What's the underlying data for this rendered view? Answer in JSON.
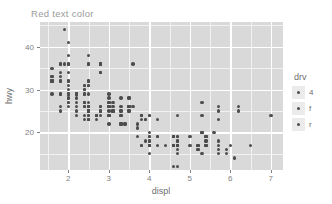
{
  "title": "Red text color",
  "colors": {
    "title_text": "#9a9a9a",
    "panel_background": "#d9d9d9",
    "grid_major": "#ffffff",
    "grid_minor": "#f2f2f2",
    "point": "#4d4d4d",
    "axis_text": "#808080",
    "legend_key_background": "#ebebeb"
  },
  "axes": {
    "x": {
      "label": "displ",
      "ticks": [
        "2",
        "3",
        "4",
        "5",
        "6",
        "7"
      ],
      "tick_values": [
        2,
        3,
        4,
        5,
        6,
        7
      ],
      "minor_values": [
        1.5,
        2.5,
        3.5,
        4.5,
        5.5,
        6.5
      ],
      "range": [
        1.3,
        7.3
      ]
    },
    "y": {
      "label": "hwy",
      "ticks": [
        "20",
        "30",
        "40"
      ],
      "tick_values": [
        20,
        30,
        40
      ],
      "minor_values": [
        15,
        25,
        35,
        45
      ],
      "range": [
        11.2,
        45.8
      ]
    }
  },
  "legend": {
    "title": "drv",
    "position": "right",
    "items": [
      {
        "label": "4"
      },
      {
        "label": "f"
      },
      {
        "label": "r"
      }
    ]
  },
  "chart_data": {
    "type": "scatter",
    "title": "Red text color",
    "xlabel": "displ",
    "ylabel": "hwy",
    "xlim": [
      1.3,
      7.3
    ],
    "ylim": [
      11.2,
      45.8
    ],
    "grid": true,
    "legend_position": "right",
    "series": [
      {
        "name": "all points",
        "points": [
          [
            1.8,
            29
          ],
          [
            1.8,
            29
          ],
          [
            2.0,
            31
          ],
          [
            2.0,
            30
          ],
          [
            2.8,
            26
          ],
          [
            2.8,
            26
          ],
          [
            3.1,
            27
          ],
          [
            1.8,
            26
          ],
          [
            1.8,
            25
          ],
          [
            2.0,
            28
          ],
          [
            2.0,
            27
          ],
          [
            2.8,
            25
          ],
          [
            2.8,
            25
          ],
          [
            3.1,
            25
          ],
          [
            3.1,
            25
          ],
          [
            2.8,
            24
          ],
          [
            3.1,
            25
          ],
          [
            4.2,
            23
          ],
          [
            5.3,
            20
          ],
          [
            5.3,
            15
          ],
          [
            5.3,
            20
          ],
          [
            5.7,
            17
          ],
          [
            6.0,
            17
          ],
          [
            5.7,
            26
          ],
          [
            5.7,
            23
          ],
          [
            6.2,
            26
          ],
          [
            6.2,
            25
          ],
          [
            7.0,
            24
          ],
          [
            5.3,
            24
          ],
          [
            5.3,
            27
          ],
          [
            5.7,
            25
          ],
          [
            6.5,
            17
          ],
          [
            2.4,
            26
          ],
          [
            2.4,
            23
          ],
          [
            3.1,
            26
          ],
          [
            3.5,
            26
          ],
          [
            3.6,
            26
          ],
          [
            2.4,
            27
          ],
          [
            3.0,
            26
          ],
          [
            3.3,
            26
          ],
          [
            3.3,
            24
          ],
          [
            3.3,
            24
          ],
          [
            3.3,
            22
          ],
          [
            3.3,
            22
          ],
          [
            3.8,
            24
          ],
          [
            3.8,
            24
          ],
          [
            4.0,
            17
          ],
          [
            3.7,
            22
          ],
          [
            3.7,
            21
          ],
          [
            3.9,
            23
          ],
          [
            3.9,
            23
          ],
          [
            4.7,
            19
          ],
          [
            4.7,
            18
          ],
          [
            4.7,
            17
          ],
          [
            5.2,
            17
          ],
          [
            5.2,
            16
          ],
          [
            3.9,
            18
          ],
          [
            4.7,
            18
          ],
          [
            4.7,
            15
          ],
          [
            4.7,
            17
          ],
          [
            5.2,
            17
          ],
          [
            5.7,
            16
          ],
          [
            5.9,
            16
          ],
          [
            4.7,
            17
          ],
          [
            4.7,
            17
          ],
          [
            4.7,
            17
          ],
          [
            4.7,
            16
          ],
          [
            4.7,
            17
          ],
          [
            5.2,
            16
          ],
          [
            5.2,
            17
          ],
          [
            5.7,
            15
          ],
          [
            5.9,
            15
          ],
          [
            4.6,
            17
          ],
          [
            5.4,
            17
          ],
          [
            5.4,
            18
          ],
          [
            4.0,
            17
          ],
          [
            4.0,
            19
          ],
          [
            4.0,
            17
          ],
          [
            4.0,
            19
          ],
          [
            4.6,
            19
          ],
          [
            5.0,
            19
          ],
          [
            4.2,
            19
          ],
          [
            4.2,
            19
          ],
          [
            4.6,
            19
          ],
          [
            4.6,
            19
          ],
          [
            4.6,
            19
          ],
          [
            5.4,
            17
          ],
          [
            5.4,
            17
          ],
          [
            3.8,
            17
          ],
          [
            3.8,
            17
          ],
          [
            4.0,
            18
          ],
          [
            4.0,
            18
          ],
          [
            4.6,
            17
          ],
          [
            4.6,
            17
          ],
          [
            4.6,
            17
          ],
          [
            4.6,
            17
          ],
          [
            5.4,
            18
          ],
          [
            1.6,
            33
          ],
          [
            1.6,
            32
          ],
          [
            1.6,
            32
          ],
          [
            1.6,
            29
          ],
          [
            1.6,
            32
          ],
          [
            1.8,
            34
          ],
          [
            1.8,
            36
          ],
          [
            1.8,
            36
          ],
          [
            2.0,
            29
          ],
          [
            2.4,
            26
          ],
          [
            2.4,
            27
          ],
          [
            2.4,
            30
          ],
          [
            2.4,
            31
          ],
          [
            2.5,
            26
          ],
          [
            2.5,
            26
          ],
          [
            3.3,
            28
          ],
          [
            2.0,
            26
          ],
          [
            2.0,
            29
          ],
          [
            2.0,
            28
          ],
          [
            2.0,
            27
          ],
          [
            2.7,
            24
          ],
          [
            2.7,
            24
          ],
          [
            2.7,
            24
          ],
          [
            3.0,
            22
          ],
          [
            3.7,
            19
          ],
          [
            4.0,
            20
          ],
          [
            4.7,
            17
          ],
          [
            4.7,
            12
          ],
          [
            4.7,
            19
          ],
          [
            5.7,
            18
          ],
          [
            6.1,
            14
          ],
          [
            4.0,
            15
          ],
          [
            4.2,
            17
          ],
          [
            4.4,
            17
          ],
          [
            4.6,
            17
          ],
          [
            5.4,
            19
          ],
          [
            5.4,
            19
          ],
          [
            5.4,
            19
          ],
          [
            4.0,
            17
          ],
          [
            4.0,
            17
          ],
          [
            4.6,
            12
          ],
          [
            5.0,
            17
          ],
          [
            2.4,
            31
          ],
          [
            2.4,
            30
          ],
          [
            2.5,
            31
          ],
          [
            2.5,
            31
          ],
          [
            3.5,
            28
          ],
          [
            3.5,
            28
          ],
          [
            3.0,
            27
          ],
          [
            3.0,
            26
          ],
          [
            3.5,
            25
          ],
          [
            3.5,
            25
          ],
          [
            3.0,
            26
          ],
          [
            3.0,
            25
          ],
          [
            3.5,
            26
          ],
          [
            3.5,
            26
          ],
          [
            3.0,
            24
          ],
          [
            3.0,
            27
          ],
          [
            3.3,
            25
          ],
          [
            3.3,
            25
          ],
          [
            4.0,
            24
          ],
          [
            5.6,
            20
          ],
          [
            3.1,
            25
          ],
          [
            3.8,
            24
          ],
          [
            3.8,
            23
          ],
          [
            3.8,
            24
          ],
          [
            5.3,
            20
          ],
          [
            2.5,
            25
          ],
          [
            2.5,
            25
          ],
          [
            2.5,
            23
          ],
          [
            2.5,
            23
          ],
          [
            2.5,
            23
          ],
          [
            2.5,
            23
          ],
          [
            2.2,
            27
          ],
          [
            2.2,
            26
          ],
          [
            2.5,
            26
          ],
          [
            2.5,
            25
          ],
          [
            2.5,
            27
          ],
          [
            2.5,
            25
          ],
          [
            2.5,
            25
          ],
          [
            2.5,
            25
          ],
          [
            2.2,
            24
          ],
          [
            2.2,
            25
          ],
          [
            2.5,
            26
          ],
          [
            2.5,
            24
          ],
          [
            2.5,
            24
          ],
          [
            2.5,
            26
          ],
          [
            2.7,
            23
          ],
          [
            2.7,
            24
          ],
          [
            3.4,
            22
          ],
          [
            3.4,
            22
          ],
          [
            4.0,
            24
          ],
          [
            4.7,
            24
          ],
          [
            2.2,
            29
          ],
          [
            2.2,
            29
          ],
          [
            2.4,
            29
          ],
          [
            2.4,
            29
          ],
          [
            3.0,
            28
          ],
          [
            3.0,
            29
          ],
          [
            3.5,
            26
          ],
          [
            2.2,
            29
          ],
          [
            2.2,
            28
          ],
          [
            2.4,
            27
          ],
          [
            2.4,
            24
          ],
          [
            3.0,
            24
          ],
          [
            3.0,
            24
          ],
          [
            3.3,
            22
          ],
          [
            1.8,
            33
          ],
          [
            1.8,
            32
          ],
          [
            1.8,
            32
          ],
          [
            2.0,
            29
          ],
          [
            2.0,
            32
          ],
          [
            2.8,
            34
          ],
          [
            2.8,
            36
          ],
          [
            3.6,
            36
          ],
          [
            1.9,
            44
          ],
          [
            2.0,
            41
          ],
          [
            2.0,
            38
          ],
          [
            2.0,
            32
          ],
          [
            2.5,
            36
          ],
          [
            2.5,
            36
          ],
          [
            2.8,
            36
          ],
          [
            2.8,
            34
          ],
          [
            1.9,
            36
          ],
          [
            2.0,
            36
          ],
          [
            2.0,
            36
          ],
          [
            2.0,
            34
          ],
          [
            2.5,
            38
          ],
          [
            2.5,
            32
          ],
          [
            2.8,
            36
          ],
          [
            2.8,
            36
          ],
          [
            1.6,
            33
          ],
          [
            1.6,
            35
          ],
          [
            1.6,
            32
          ],
          [
            1.6,
            32
          ],
          [
            2.5,
            29
          ],
          [
            2.5,
            32
          ],
          [
            2.8,
            34
          ],
          [
            2.8,
            36
          ]
        ]
      }
    ]
  }
}
